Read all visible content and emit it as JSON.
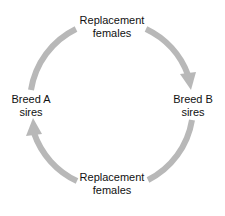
{
  "diagram": {
    "type": "cycle",
    "nodes": [
      {
        "id": "top",
        "line1": "Replacement",
        "line2": "females"
      },
      {
        "id": "right",
        "line1": "Breed B",
        "line2": "sires"
      },
      {
        "id": "bottom",
        "line1": "Replacement",
        "line2": "females"
      },
      {
        "id": "left",
        "line1": "Breed A",
        "line2": "sires"
      }
    ],
    "edges": [
      {
        "from": "left",
        "to": "top",
        "arrowhead": false
      },
      {
        "from": "top",
        "to": "right",
        "arrowhead": true
      },
      {
        "from": "right",
        "to": "bottom",
        "arrowhead": false
      },
      {
        "from": "bottom",
        "to": "left",
        "arrowhead": true
      }
    ],
    "arrow_color": "#b8b8b8"
  }
}
